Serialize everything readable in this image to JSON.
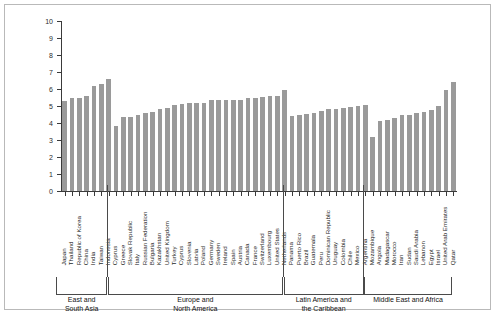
{
  "chart_data": {
    "type": "bar",
    "title": "",
    "xlabel": "",
    "ylabel": "",
    "ylim": [
      0,
      10
    ],
    "ytick_labels": [
      "0",
      "1",
      "2",
      "3",
      "4",
      "5",
      "6",
      "7",
      "8",
      "9",
      "10"
    ],
    "ytick_values": [
      0,
      1,
      2,
      3,
      4,
      5,
      6,
      7,
      8,
      9,
      10
    ],
    "grid": false,
    "legend": "none",
    "bar_color": "#9a9a9a",
    "categories": [
      "Japan",
      "Thailand",
      "Republic of Korea",
      "China",
      "India",
      "Taiwan",
      "Indonesia",
      "Cyprus",
      "Greece",
      "Slovak Republic",
      "Italy",
      "Russian Federation",
      "Bulgaria",
      "Kazakhstan",
      "United Kingdom",
      "Turkey",
      "Cyprus",
      "Slovenia",
      "Latvia",
      "Poland",
      "Germany",
      "Sweden",
      "Ireland",
      "Spain",
      "Austria",
      "Canada",
      "France",
      "Switzerland",
      "Luxembourg",
      "United States",
      "Netherlands",
      "Panama",
      "Puerto Rico",
      "Brazil",
      "Guatemala",
      "Peru",
      "Dominican Republic",
      "Uruguay",
      "Colombia",
      "Chile",
      "Mexico",
      "Argentina",
      "Mozambique",
      "Angola",
      "Madagascar",
      "Morocco",
      "Iran",
      "Sudan",
      "Saudi Arabia",
      "Lebanon",
      "Egypt",
      "Israel",
      "United Arab Emirates",
      "Qatar"
    ],
    "values": [
      5.3,
      5.5,
      5.5,
      5.6,
      6.15,
      6.3,
      6.6,
      3.8,
      4.35,
      4.35,
      4.5,
      4.6,
      4.65,
      4.85,
      4.9,
      5.05,
      5.1,
      5.2,
      5.2,
      5.15,
      5.35,
      5.35,
      5.35,
      5.35,
      5.35,
      5.5,
      5.5,
      5.55,
      5.6,
      5.6,
      5.95,
      4.4,
      4.45,
      4.55,
      4.6,
      4.7,
      4.8,
      4.85,
      4.9,
      4.95,
      5.0,
      5.05,
      3.2,
      4.1,
      4.15,
      4.3,
      4.45,
      4.5,
      4.6,
      4.65,
      4.75,
      5.0,
      5.95,
      6.4
    ],
    "groups": [
      {
        "name": "East and\nSouth Asia",
        "start_index": 0,
        "end_index": 6
      },
      {
        "name": "Europe and\nNorth America",
        "start_index": 7,
        "end_index": 30
      },
      {
        "name": "Latin America and\nthe Caribbean",
        "start_index": 31,
        "end_index": 41
      },
      {
        "name": "Middle East and Africa",
        "start_index": 42,
        "end_index": 53
      }
    ]
  }
}
